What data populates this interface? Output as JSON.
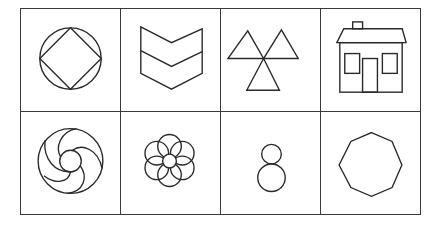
{
  "figure": {
    "layout": {
      "rows": 2,
      "columns": 4
    },
    "stroke_color": "#2a2a2a",
    "border_color": "#3a3a3a",
    "background": "#ffffff",
    "cells": [
      {
        "row": 1,
        "col": 1,
        "icon": "circle-inscribed-diamond-icon",
        "label": "Circle with inscribed diamond"
      },
      {
        "row": 1,
        "col": 2,
        "icon": "double-chevron-icon",
        "label": "Stacked chevrons"
      },
      {
        "row": 1,
        "col": 3,
        "icon": "three-triangles-icon",
        "label": "Three triangles meeting at a point"
      },
      {
        "row": 1,
        "col": 4,
        "icon": "house-icon",
        "label": "House"
      },
      {
        "row": 2,
        "col": 1,
        "icon": "swirl-circle-icon",
        "label": "Swirl inside circle"
      },
      {
        "row": 2,
        "col": 2,
        "icon": "flower-icon",
        "label": "Flower"
      },
      {
        "row": 2,
        "col": 3,
        "icon": "two-stacked-circles-icon",
        "label": "Two stacked circles"
      },
      {
        "row": 2,
        "col": 4,
        "icon": "octagon-icon",
        "label": "Octagon"
      }
    ]
  }
}
